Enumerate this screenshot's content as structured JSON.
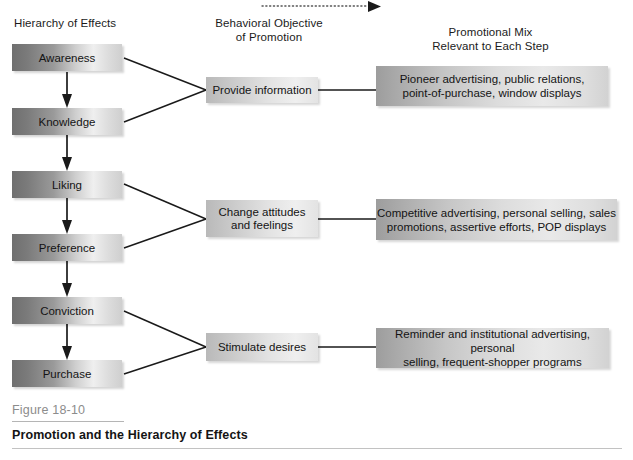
{
  "figure": {
    "number": "Figure 18-10",
    "title": "Promotion and the Hierarchy of Effects"
  },
  "columns": {
    "hierarchy": {
      "heading": "Hierarchy of Effects"
    },
    "behavioral": {
      "heading": "Behavioral Objective\nof Promotion"
    },
    "mix": {
      "heading": "Promotional Mix\nRelevant to Each Step"
    }
  },
  "hierarchy_steps": [
    {
      "label": "Awareness"
    },
    {
      "label": "Knowledge"
    },
    {
      "label": "Liking"
    },
    {
      "label": "Preference"
    },
    {
      "label": "Conviction"
    },
    {
      "label": "Purchase"
    }
  ],
  "behavioral_objectives": [
    {
      "label": "Provide information"
    },
    {
      "label": "Change attitudes\nand feelings"
    },
    {
      "label": "Stimulate desires"
    }
  ],
  "promotional_mix": [
    {
      "label": "Pioneer advertising, public relations,\npoint-of-purchase, window displays"
    },
    {
      "label": "Competitive advertising, personal selling, sales\npromotions, assertive efforts, POP displays"
    },
    {
      "label": "Reminder and institutional advertising, personal\nselling, frequent-shopper programs"
    }
  ],
  "colors": {
    "ink": "#141414",
    "caption_gray": "#8c8c8c",
    "rule_gray": "#b5b5b5",
    "box_dark": "#6f6f6f",
    "box_light": "#efefef"
  }
}
